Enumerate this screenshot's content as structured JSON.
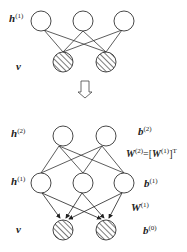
{
  "top": {
    "hidden_label": "h",
    "hidden_sup": "(1)",
    "visible_label": "v"
  },
  "arrow": "down-hollow-arrow",
  "bottom": {
    "h2_label": "h",
    "h2_sup": "(2)",
    "b2_label": "b",
    "b2_sup": "(2)",
    "w2_label": "W",
    "w2_sup": "(2)",
    "w2_eq": "=[",
    "w2_rhs": "W",
    "w2_rhs_sup": "(1)",
    "w2_close": "]",
    "w2_T": "T",
    "h1_label": "h",
    "h1_sup": "(1)",
    "b1_label": "b",
    "b1_sup": "(1)",
    "w1_label": "W",
    "w1_sup": "(1)",
    "v_label": "v",
    "b0_label": "b",
    "b0_sup": "(0)"
  }
}
